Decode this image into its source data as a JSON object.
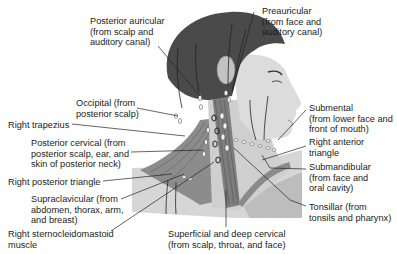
{
  "diagram": {
    "labels": [
      {
        "id": "posterior-auricular",
        "text": "Posterior auricular\n(from scalp and\nauditory canal)",
        "x": 90,
        "y": 16
      },
      {
        "id": "preauricular",
        "text": "Preauricular\n(from face and\nauditory canal)",
        "x": 262,
        "y": 6
      },
      {
        "id": "occipital",
        "text": "Occipital (from\nposterior scalp)",
        "x": 76,
        "y": 98
      },
      {
        "id": "right-trapezius",
        "text": "Right trapezius",
        "x": 8,
        "y": 120
      },
      {
        "id": "submental",
        "text": "Submental\n(from lower face and\nfront of mouth)",
        "x": 309,
        "y": 103
      },
      {
        "id": "posterior-cervical",
        "text": "Posterior cervical (from\nposterior scalp, ear, and\nskin of posterior neck)",
        "x": 31,
        "y": 138
      },
      {
        "id": "right-anterior-triangle",
        "text": "Right anterior\ntriangle",
        "x": 309,
        "y": 137
      },
      {
        "id": "right-posterior-triangle",
        "text": "Right posterior triangle",
        "x": 8,
        "y": 177
      },
      {
        "id": "submandibular",
        "text": "Submandibular\n(from face and\noral cavity)",
        "x": 309,
        "y": 162
      },
      {
        "id": "supraclavicular",
        "text": "Supraclavicular (from\nabdomen, thorax, arm,\nand breast)",
        "x": 31,
        "y": 194
      },
      {
        "id": "tonsillar",
        "text": "Tonsillar (from\ntonsils and pharynx)",
        "x": 309,
        "y": 202
      },
      {
        "id": "right-sternocleidomastoid",
        "text": "Right sternocleidomastoid\nmuscle",
        "x": 8,
        "y": 229
      },
      {
        "id": "superficial-deep-cervical",
        "text": "Superficial and deep cervical\n(from scalp, throat, and face)",
        "x": 168,
        "y": 229
      }
    ],
    "colors": {
      "hair": "#4a4a4a",
      "skin": "#d9d9d9",
      "skin_shadow": "#bcbcbc",
      "muscle": "#8a8a8a",
      "node": "#f4f4f4",
      "leader": "#222222"
    }
  }
}
